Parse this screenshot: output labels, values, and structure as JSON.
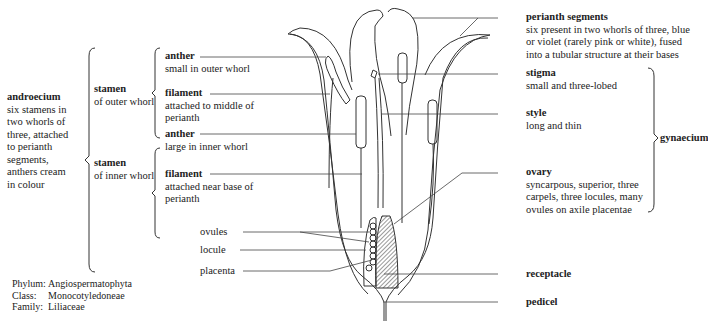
{
  "diagram": {
    "androecium": {
      "title": "androecium",
      "desc": [
        "six stamens in",
        "two whorls of",
        "three, attached",
        "to perianth",
        "segments,",
        "anthers cream",
        "in colour"
      ]
    },
    "stamen_outer": {
      "title": "stamen",
      "desc": "of outer whorl",
      "anther": {
        "title": "anther",
        "desc": "small in outer whorl"
      },
      "filament": {
        "title": "filament",
        "desc": [
          "attached to middle of",
          "perianth"
        ]
      }
    },
    "stamen_inner": {
      "title": "stamen",
      "desc": "of inner whorl",
      "anther": {
        "title": "anther",
        "desc": "large in inner whorl"
      },
      "filament": {
        "title": "filament",
        "desc": [
          "attached near base of",
          "perianth"
        ]
      }
    },
    "perianth": {
      "title": "perianth segments",
      "desc": [
        "six present in two whorls of three, blue",
        "or violet (rarely pink or white), fused",
        "into a tubular structure at their bases"
      ]
    },
    "stigma": {
      "title": "stigma",
      "desc": "small and three-lobed"
    },
    "style": {
      "title": "style",
      "desc": "long and thin"
    },
    "ovary": {
      "title": "ovary",
      "desc": [
        "syncarpous, superior, three",
        "carpels, three locules, many",
        "ovules on axile placentae"
      ]
    },
    "gynaecium": {
      "title": "gynaecium"
    },
    "ovules": "ovules",
    "locule": "locule",
    "placenta": "placenta",
    "receptacle": "receptacle",
    "pedicel": "pedicel",
    "taxonomy": [
      {
        "key": "Phylum:",
        "value": "Angiospermatophyta"
      },
      {
        "key": "Class:",
        "value": "Monocotyledoneae"
      },
      {
        "key": "Family:",
        "value": "Liliaceae"
      }
    ]
  }
}
